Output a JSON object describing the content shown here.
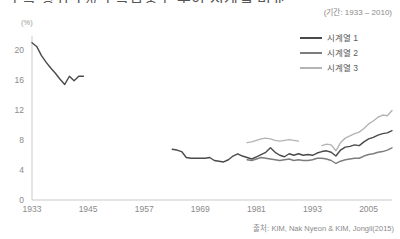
{
  "chart_title": "소득 상위 1% 소득집중도 추이 시계열 비교",
  "subtitle": "(기간: 1933 – 2010)",
  "source": "출처: KIM, Nak Nyeon & KIM, Jongil(2015)",
  "y_axis_unit": "(%)",
  "legend": {
    "position": "top-right",
    "items": [
      {
        "label": "시계열 1",
        "color": "#4a4a4a"
      },
      {
        "label": "시계열 2",
        "color": "#7d7d7d"
      },
      {
        "label": "시계열 3",
        "color": "#b4b4b4"
      }
    ]
  },
  "axis": {
    "y_ticks": [
      "0",
      "4",
      "8",
      "12",
      "16",
      "20"
    ],
    "x_ticks": [
      "1933",
      "1945",
      "1957",
      "1969",
      "1981",
      "1993",
      "2005"
    ]
  },
  "chart_data": {
    "type": "line",
    "title": "소득 상위 1% 소득집중도 추이 시계열 비교",
    "subtitle": "(기간: 1933 – 2010)",
    "xlabel": "",
    "ylabel": "(%)",
    "xlim": [
      1933,
      2010
    ],
    "ylim": [
      0,
      22
    ],
    "x_ticks": [
      1933,
      1945,
      1957,
      1969,
      1981,
      1993,
      2005
    ],
    "y_ticks": [
      0,
      4,
      8,
      12,
      16,
      20
    ],
    "grid": false,
    "legend_position": "top-right",
    "source": "출처: KIM, Nak Nyeon & KIM, Jongil(2015)",
    "series": [
      {
        "name": "시계열 1",
        "color": "#4a4a4a",
        "segments": [
          {
            "x": [
              1933,
              1934,
              1935,
              1936,
              1937,
              1938,
              1939,
              1940,
              1941,
              1942,
              1943,
              1944
            ],
            "y": [
              21.1,
              20.6,
              19.4,
              18.5,
              17.7,
              17.0,
              16.2,
              15.5,
              16.6,
              16.0,
              16.6,
              16.6
            ]
          },
          {
            "x": [
              1963,
              1964,
              1965,
              1966,
              1967,
              1968,
              1969,
              1970,
              1971,
              1972,
              1973,
              1974,
              1975,
              1976,
              1977,
              1978,
              1979,
              1980,
              1981,
              1982,
              1983,
              1984,
              1985,
              1986,
              1987,
              1988,
              1989,
              1990,
              1991,
              1992,
              1993,
              1994,
              1995,
              1996,
              1997,
              1998,
              1999,
              2000,
              2001,
              2002,
              2003,
              2004,
              2005,
              2006,
              2007,
              2008,
              2009,
              2010
            ],
            "y": [
              6.8,
              6.7,
              6.5,
              5.7,
              5.6,
              5.6,
              5.6,
              5.6,
              5.7,
              5.3,
              5.2,
              5.1,
              5.4,
              5.9,
              6.2,
              5.9,
              5.7,
              5.5,
              5.8,
              6.1,
              6.4,
              7.0,
              6.4,
              6.0,
              5.8,
              6.2,
              6.0,
              6.2,
              6.0,
              6.1,
              6.0,
              6.3,
              6.5,
              6.6,
              6.4,
              5.9,
              6.7,
              7.1,
              7.2,
              7.4,
              7.3,
              7.8,
              8.2,
              8.4,
              8.7,
              8.9,
              9.0,
              9.3
            ]
          }
        ]
      },
      {
        "name": "시계열 2",
        "color": "#7d7d7d",
        "segments": [
          {
            "x": [
              1979,
              1980,
              1981,
              1982,
              1983,
              1984,
              1985,
              1986,
              1987,
              1988,
              1989,
              1990,
              1991,
              1992,
              1993,
              1994,
              1995,
              1996,
              1997,
              1998,
              1999,
              2000,
              2001,
              2002,
              2003,
              2004,
              2005,
              2006,
              2007,
              2008,
              2009,
              2010
            ],
            "y": [
              5.4,
              5.3,
              5.5,
              5.7,
              5.6,
              5.5,
              5.4,
              5.3,
              5.4,
              5.5,
              5.3,
              5.4,
              5.3,
              5.3,
              5.4,
              5.6,
              5.6,
              5.5,
              5.3,
              4.9,
              5.2,
              5.4,
              5.5,
              5.6,
              5.6,
              5.9,
              6.1,
              6.2,
              6.4,
              6.5,
              6.7,
              7.0
            ]
          }
        ]
      },
      {
        "name": "시계열 3",
        "color": "#b4b4b4",
        "segments": [
          {
            "x": [
              1979,
              1980,
              1981,
              1982,
              1983,
              1984,
              1985,
              1986,
              1987,
              1988,
              1989,
              1990
            ],
            "y": [
              7.7,
              7.8,
              8.0,
              8.2,
              8.3,
              8.2,
              8.0,
              7.9,
              8.0,
              8.1,
              8.0,
              7.9
            ]
          },
          {
            "x": [
              1995,
              1996,
              1997,
              1998,
              1999,
              2000,
              2001,
              2002,
              2003,
              2004,
              2005,
              2006,
              2007,
              2008,
              2009,
              2010
            ],
            "y": [
              7.3,
              7.5,
              7.4,
              6.6,
              7.7,
              8.3,
              8.6,
              8.9,
              9.1,
              9.6,
              10.2,
              10.6,
              11.1,
              11.4,
              11.3,
              12.0
            ]
          }
        ]
      }
    ]
  }
}
